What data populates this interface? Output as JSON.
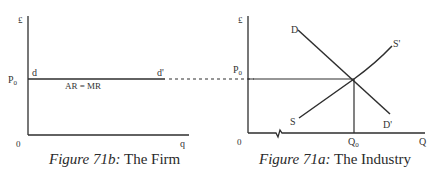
{
  "figure_b": {
    "caption_italic": "Figure 71b:",
    "caption_rest": " The Firm",
    "y_axis_label": "£",
    "x_axis_label": "q",
    "origin_label": "0",
    "price_label": "P",
    "price_sub": "0",
    "curve_start_label": "d",
    "curve_end_label": "d'",
    "curve_label": "AR = MR"
  },
  "figure_a": {
    "caption_italic": "Figure 71a:",
    "caption_rest": " The Industry",
    "y_axis_label": "£",
    "x_axis_label": "Q",
    "origin_label": "0",
    "price_label": "P",
    "price_sub": "0",
    "quantity_label": "Q",
    "quantity_sub": "0",
    "demand_start_label": "D",
    "demand_end_label": "D'",
    "supply_start_label": "S",
    "supply_end_label": "S'"
  },
  "colors": {
    "line": "#2e2e2e",
    "text": "#333333",
    "background": "#ffffff"
  }
}
